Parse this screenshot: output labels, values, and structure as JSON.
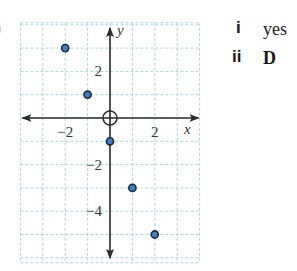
{
  "edge_fragment": ")",
  "chart_data": {
    "type": "scatter",
    "title": "",
    "xlabel": "x",
    "ylabel": "y",
    "xlim": [
      -4,
      4
    ],
    "ylim": [
      -6,
      4
    ],
    "x_ticks_labeled": [
      -2,
      2
    ],
    "y_ticks_labeled": [
      2,
      -2,
      -4
    ],
    "x_tick_labels": [
      "−2",
      "2"
    ],
    "y_tick_labels": [
      "2",
      "−2",
      "−4"
    ],
    "grid": true,
    "grid_style": "dashed light blue, 1 unit spacing",
    "origin_marker": "circle-with-cross",
    "axes_arrows": true,
    "points": [
      {
        "x": -2,
        "y": 3
      },
      {
        "x": -1,
        "y": 1
      },
      {
        "x": 0,
        "y": -1
      },
      {
        "x": 1,
        "y": -3
      },
      {
        "x": 2,
        "y": -5
      }
    ],
    "colors": {
      "grid": "#a9d4e4",
      "axes": "#2b2b2b",
      "point_fill": "#3d7fc1",
      "point_stroke": "#1d2a3a"
    }
  },
  "answers": [
    {
      "label": "i",
      "value": "yes"
    },
    {
      "label": "ii",
      "value": "D"
    }
  ]
}
